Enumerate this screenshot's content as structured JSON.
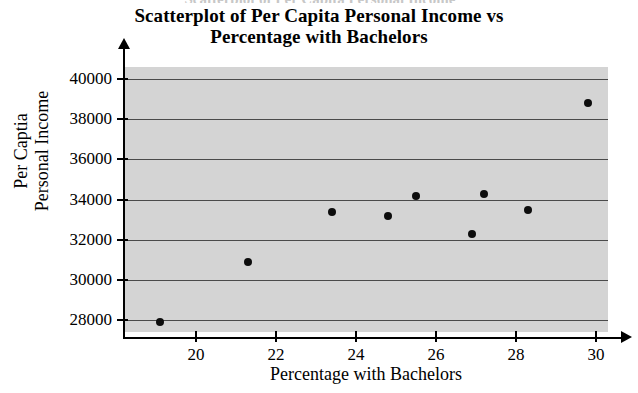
{
  "figure": {
    "clipped_text_above": "Scatterplot of Per Capita Personal Income",
    "title_line1": "Scatterplot of Per Capita Personal Income vs",
    "title_line2": "Percentage with Bachelors",
    "plot_background_color": "#d4d4d4",
    "point_color": "#0d0d0d",
    "gridline_color": "#4a4a4a",
    "axis_color": "#000000"
  },
  "chart_data": {
    "type": "scatter",
    "title": "Scatterplot of Per Capita Personal Income vs Percentage with Bachelors",
    "xlabel": "Percentage with Bachelors",
    "ylabel_line1": "Per Captia",
    "ylabel_line2": "Personal Income",
    "ylabel": "Per Captia Personal Income",
    "xlim": [
      18.2,
      30.3
    ],
    "ylim": [
      27400,
      40600
    ],
    "xticks": [
      20,
      22,
      24,
      26,
      28,
      30
    ],
    "yticks": [
      28000,
      30000,
      32000,
      34000,
      36000,
      38000,
      40000
    ],
    "xtick_labels": [
      "20",
      "22",
      "24",
      "26",
      "28",
      "30"
    ],
    "ytick_labels": [
      "28000",
      "30000",
      "32000",
      "34000",
      "36000",
      "38000",
      "40000"
    ],
    "grid": true,
    "grid_axis": "y",
    "legend": null,
    "marker": "filled-circle",
    "x": [
      19.1,
      21.3,
      23.4,
      24.8,
      25.5,
      26.9,
      27.2,
      28.3,
      29.8
    ],
    "y": [
      27900,
      30900,
      33400,
      33200,
      34200,
      32300,
      34300,
      33500,
      38800
    ],
    "points": [
      {
        "x": 19.1,
        "y": 27900
      },
      {
        "x": 21.3,
        "y": 30900
      },
      {
        "x": 23.4,
        "y": 33400
      },
      {
        "x": 24.8,
        "y": 33200
      },
      {
        "x": 25.5,
        "y": 34200
      },
      {
        "x": 26.9,
        "y": 32300
      },
      {
        "x": 27.2,
        "y": 34300
      },
      {
        "x": 28.3,
        "y": 33500
      },
      {
        "x": 29.8,
        "y": 38800
      }
    ]
  }
}
